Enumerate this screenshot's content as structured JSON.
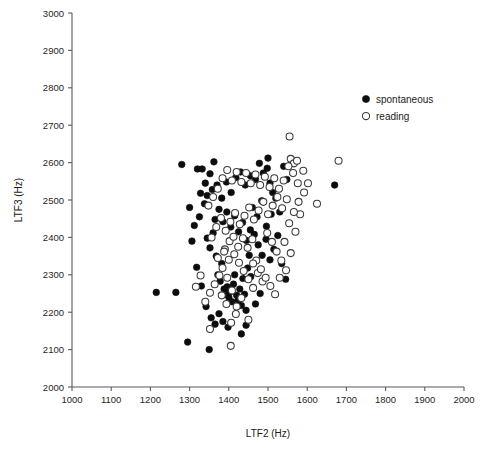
{
  "chart_data": {
    "type": "scatter",
    "title": "",
    "xlabel": "LTF2 (Hz)",
    "ylabel": "LTF3 (Hz)",
    "xlim": [
      1000,
      2000
    ],
    "ylim": [
      2000,
      3000
    ],
    "xticks": [
      1000,
      1100,
      1200,
      1300,
      1400,
      1500,
      1600,
      1700,
      1800,
      1900,
      2000
    ],
    "yticks": [
      2000,
      2100,
      2200,
      2300,
      2400,
      2500,
      2600,
      2700,
      2800,
      2900,
      3000
    ],
    "grid": false,
    "legend_position": "upper-right",
    "series": [
      {
        "name": "spontaneous",
        "marker": "filled-circle",
        "color": "#0d0d0d",
        "points": [
          [
            1215,
            2253
          ],
          [
            1265,
            2253
          ],
          [
            1280,
            2595
          ],
          [
            1320,
            2583
          ],
          [
            1332,
            2583
          ],
          [
            1295,
            2120
          ],
          [
            1350,
            2100
          ],
          [
            1300,
            2480
          ],
          [
            1312,
            2432
          ],
          [
            1325,
            2455
          ],
          [
            1338,
            2490
          ],
          [
            1345,
            2398
          ],
          [
            1352,
            2372
          ],
          [
            1360,
            2412
          ],
          [
            1368,
            2350
          ],
          [
            1372,
            2300
          ],
          [
            1378,
            2283
          ],
          [
            1382,
            2330
          ],
          [
            1388,
            2262
          ],
          [
            1392,
            2248
          ],
          [
            1396,
            2268
          ],
          [
            1400,
            2240
          ],
          [
            1404,
            2255
          ],
          [
            1408,
            2228
          ],
          [
            1412,
            2275
          ],
          [
            1415,
            2300
          ],
          [
            1420,
            2245
          ],
          [
            1424,
            2232
          ],
          [
            1428,
            2262
          ],
          [
            1432,
            2218
          ],
          [
            1436,
            2290
          ],
          [
            1440,
            2248
          ],
          [
            1444,
            2205
          ],
          [
            1448,
            2318
          ],
          [
            1452,
            2352
          ],
          [
            1306,
            2390
          ],
          [
            1318,
            2320
          ],
          [
            1330,
            2270
          ],
          [
            1342,
            2215
          ],
          [
            1355,
            2185
          ],
          [
            1365,
            2168
          ],
          [
            1375,
            2196
          ],
          [
            1385,
            2175
          ],
          [
            1398,
            2160
          ],
          [
            1345,
            2512
          ],
          [
            1358,
            2528
          ],
          [
            1370,
            2540
          ],
          [
            1382,
            2505
          ],
          [
            1394,
            2548
          ],
          [
            1406,
            2520
          ],
          [
            1418,
            2560
          ],
          [
            1430,
            2575
          ],
          [
            1442,
            2540
          ],
          [
            1455,
            2565
          ],
          [
            1468,
            2555
          ],
          [
            1478,
            2598
          ],
          [
            1488,
            2572
          ],
          [
            1498,
            2585
          ],
          [
            1505,
            2545
          ],
          [
            1512,
            2520
          ],
          [
            1460,
            2480
          ],
          [
            1472,
            2455
          ],
          [
            1484,
            2498
          ],
          [
            1496,
            2430
          ],
          [
            1508,
            2462
          ],
          [
            1520,
            2505
          ],
          [
            1530,
            2468
          ],
          [
            1540,
            2590
          ],
          [
            1548,
            2555
          ],
          [
            1465,
            2408
          ],
          [
            1475,
            2380
          ],
          [
            1485,
            2352
          ],
          [
            1495,
            2395
          ],
          [
            1505,
            2340
          ],
          [
            1515,
            2368
          ],
          [
            1525,
            2405
          ],
          [
            1535,
            2330
          ],
          [
            1545,
            2288
          ],
          [
            1455,
            2420
          ],
          [
            1445,
            2392
          ],
          [
            1435,
            2440
          ],
          [
            1425,
            2415
          ],
          [
            1415,
            2458
          ],
          [
            1405,
            2428
          ],
          [
            1395,
            2468
          ],
          [
            1385,
            2442
          ],
          [
            1375,
            2475
          ],
          [
            1365,
            2448
          ],
          [
            1670,
            2540
          ],
          [
            1560,
            2600
          ],
          [
            1352,
            2570
          ],
          [
            1340,
            2545
          ],
          [
            1328,
            2518
          ],
          [
            1362,
            2602
          ],
          [
            1500,
            2612
          ],
          [
            1480,
            2250
          ],
          [
            1468,
            2222
          ],
          [
            1456,
            2295
          ],
          [
            1444,
            2165
          ],
          [
            1432,
            2142
          ]
        ]
      },
      {
        "name": "reading",
        "marker": "open-circle",
        "color": "#3b3b3b",
        "points": [
          [
            1555,
            2670
          ],
          [
            1680,
            2605
          ],
          [
            1625,
            2490
          ],
          [
            1450,
            2180
          ],
          [
            1405,
            2110
          ],
          [
            1420,
            2215
          ],
          [
            1432,
            2238
          ],
          [
            1408,
            2258
          ],
          [
            1396,
            2292
          ],
          [
            1384,
            2318
          ],
          [
            1372,
            2345
          ],
          [
            1390,
            2368
          ],
          [
            1402,
            2390
          ],
          [
            1414,
            2355
          ],
          [
            1426,
            2332
          ],
          [
            1438,
            2310
          ],
          [
            1450,
            2288
          ],
          [
            1462,
            2265
          ],
          [
            1474,
            2305
          ],
          [
            1486,
            2282
          ],
          [
            1356,
            2400
          ],
          [
            1368,
            2428
          ],
          [
            1380,
            2452
          ],
          [
            1392,
            2418
          ],
          [
            1404,
            2442
          ],
          [
            1416,
            2465
          ],
          [
            1428,
            2435
          ],
          [
            1440,
            2458
          ],
          [
            1452,
            2480
          ],
          [
            1464,
            2448
          ],
          [
            1476,
            2472
          ],
          [
            1488,
            2495
          ],
          [
            1500,
            2462
          ],
          [
            1512,
            2485
          ],
          [
            1524,
            2508
          ],
          [
            1536,
            2478
          ],
          [
            1548,
            2502
          ],
          [
            1558,
            2610
          ],
          [
            1566,
            2598
          ],
          [
            1574,
            2605
          ],
          [
            1540,
            2552
          ],
          [
            1528,
            2530
          ],
          [
            1516,
            2558
          ],
          [
            1504,
            2535
          ],
          [
            1492,
            2562
          ],
          [
            1480,
            2540
          ],
          [
            1468,
            2568
          ],
          [
            1456,
            2545
          ],
          [
            1444,
            2572
          ],
          [
            1432,
            2548
          ],
          [
            1420,
            2575
          ],
          [
            1408,
            2552
          ],
          [
            1396,
            2580
          ],
          [
            1384,
            2558
          ],
          [
            1372,
            2530
          ],
          [
            1360,
            2508
          ],
          [
            1348,
            2485
          ],
          [
            1498,
            2412
          ],
          [
            1510,
            2388
          ],
          [
            1522,
            2362
          ],
          [
            1534,
            2338
          ],
          [
            1546,
            2312
          ],
          [
            1558,
            2358
          ],
          [
            1570,
            2415
          ],
          [
            1582,
            2462
          ],
          [
            1592,
            2520
          ],
          [
            1576,
            2545
          ],
          [
            1564,
            2572
          ],
          [
            1552,
            2590
          ],
          [
            1460,
            2395
          ],
          [
            1448,
            2372
          ],
          [
            1436,
            2398
          ],
          [
            1424,
            2375
          ],
          [
            1412,
            2402
          ],
          [
            1400,
            2340
          ],
          [
            1388,
            2362
          ],
          [
            1376,
            2298
          ],
          [
            1364,
            2275
          ],
          [
            1352,
            2252
          ],
          [
            1340,
            2228
          ],
          [
            1328,
            2298
          ],
          [
            1316,
            2268
          ],
          [
            1418,
            2195
          ],
          [
            1406,
            2172
          ],
          [
            1394,
            2222
          ],
          [
            1382,
            2245
          ],
          [
            1470,
            2338
          ],
          [
            1482,
            2315
          ],
          [
            1494,
            2292
          ],
          [
            1506,
            2270
          ],
          [
            1518,
            2248
          ],
          [
            1530,
            2292
          ],
          [
            1542,
            2388
          ],
          [
            1554,
            2438
          ],
          [
            1566,
            2468
          ],
          [
            1578,
            2495
          ],
          [
            1590,
            2578
          ],
          [
            1602,
            2545
          ],
          [
            1352,
            2155
          ],
          [
            1462,
            2330
          ]
        ]
      }
    ]
  },
  "legend": {
    "entries": [
      {
        "label": "spontaneous"
      },
      {
        "label": "reading"
      }
    ]
  },
  "axes": {
    "x": {
      "title": "LTF2 (Hz)"
    },
    "y": {
      "title": "LTF3 (Hz)"
    }
  }
}
